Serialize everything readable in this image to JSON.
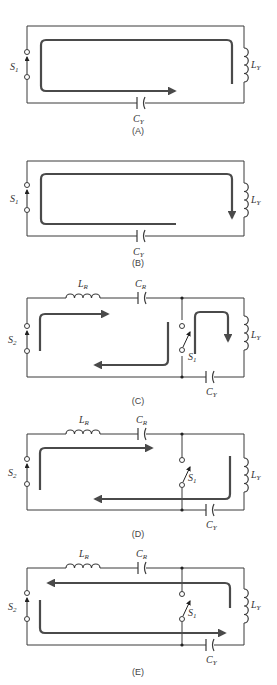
{
  "figure": {
    "panels": [
      {
        "id": "A",
        "caption": "(A)",
        "labels": {
          "switch": "S",
          "switch_sub": "1",
          "inductor": "L",
          "inductor_sub": "Y",
          "capacitor": "C",
          "capacitor_sub": "Y"
        }
      },
      {
        "id": "B",
        "caption": "(B)",
        "labels": {
          "switch": "S",
          "switch_sub": "1",
          "inductor": "L",
          "inductor_sub": "Y",
          "capacitor": "C",
          "capacitor_sub": "Y"
        }
      },
      {
        "id": "C",
        "caption": "(C)",
        "labels": {
          "switch2": "S",
          "switch2_sub": "2",
          "inductor_r": "L",
          "inductor_r_sub": "R",
          "capacitor_r": "C",
          "capacitor_r_sub": "R",
          "switch1": "S",
          "switch1_sub": "1",
          "inductor_y": "L",
          "inductor_y_sub": "Y",
          "capacitor_y": "C",
          "capacitor_y_sub": "Y"
        }
      },
      {
        "id": "D",
        "caption": "(D)",
        "labels": {
          "switch2": "S",
          "switch2_sub": "2",
          "inductor_r": "L",
          "inductor_r_sub": "R",
          "capacitor_r": "C",
          "capacitor_r_sub": "R",
          "switch1": "S",
          "switch1_sub": "1",
          "inductor_y": "L",
          "inductor_y_sub": "Y",
          "capacitor_y": "C",
          "capacitor_y_sub": "Y"
        }
      },
      {
        "id": "E",
        "caption": "(E)",
        "labels": {
          "switch2": "S",
          "switch2_sub": "2",
          "inductor_r": "L",
          "inductor_r_sub": "R",
          "capacitor_r": "C",
          "capacitor_r_sub": "R",
          "switch1": "S",
          "switch1_sub": "1",
          "inductor_y": "L",
          "inductor_y_sub": "Y",
          "capacitor_y": "C",
          "capacitor_y_sub": "Y"
        }
      }
    ],
    "colors": {
      "wire": "#3a3a3a",
      "current_arrow": "#4a4a4a",
      "background": "#ffffff"
    }
  }
}
